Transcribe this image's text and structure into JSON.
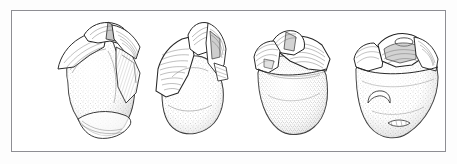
{
  "figure": {
    "kind": "archaeological-line-drawing",
    "title": "Lithic core — four views",
    "technique": "pen-and-ink stipple",
    "view_count": 4,
    "caption": "",
    "scale_bar": "",
    "labels": [],
    "colors": {
      "page_background": "#fdfdfd",
      "frame_background": "#ffffff",
      "frame_border": "#8e8e93",
      "ink_outline": "#2b2b2b",
      "ink_hatch": "#4a4a4a",
      "stipple": "#7a7a7a",
      "shadow_wash": "#cfcfcf"
    },
    "frame": {
      "x": 11,
      "y": 10,
      "width": 435,
      "height": 142,
      "border_width": 1
    },
    "specimens": [
      {
        "index": 1,
        "name": "view-a-oblique-left",
        "description": "Core seen obliquely from the left; broad stippled cortical face with flaked ridge and faceted platform at apex",
        "cx": 94,
        "cy": 73,
        "width": 98,
        "height": 116
      },
      {
        "index": 2,
        "name": "view-b-oblique-right",
        "description": "Core rotated ninety degrees; prominent lateral flake scar with fine parallel hatching sweeping to the left edge",
        "cx": 188,
        "cy": 76,
        "width": 86,
        "height": 112
      },
      {
        "index": 3,
        "name": "view-c-frontal",
        "description": "Frontal view; rounded stippled body below an irregular, heavily flaked and hatched upper margin",
        "cx": 283,
        "cy": 74,
        "width": 84,
        "height": 116
      },
      {
        "index": 4,
        "name": "view-d-reverse",
        "description": "Reverse view; wedge-shaped stippled body with a crescentic scar low on the left and a small notched flake row near the base",
        "cx": 383,
        "cy": 76,
        "width": 92,
        "height": 112
      }
    ]
  }
}
